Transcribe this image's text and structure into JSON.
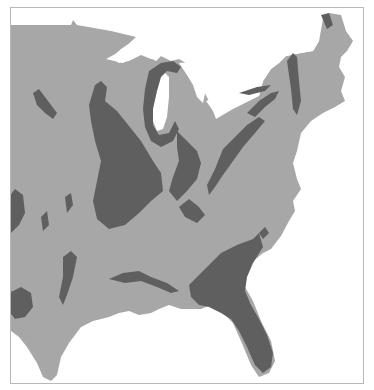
{
  "map": {
    "region": "Eastern United States",
    "colors": {
      "background": "#ffffff",
      "land": "#a7a7a7",
      "highlighted_rock": "#5f5f5f",
      "water": "#ffffff",
      "frame": "#b8b8b8"
    },
    "legend": null,
    "labels": []
  }
}
